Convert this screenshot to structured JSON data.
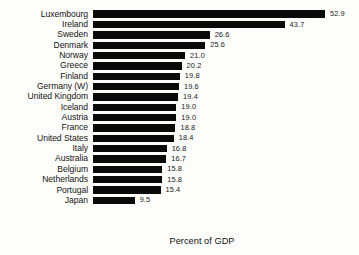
{
  "chart_data": {
    "type": "bar",
    "orientation": "horizontal",
    "title": "",
    "xlabel": "Percent of GDP",
    "ylabel": "",
    "grid": false,
    "legend": null,
    "xlim": [
      0,
      56
    ],
    "categories": [
      "Luxembourg",
      "Ireland",
      "Sweden",
      "Denmark",
      "Norway",
      "Greece",
      "Finland",
      "Germany (W)",
      "United Kingdom",
      "Iceland",
      "Austria",
      "France",
      "United States",
      "Italy",
      "Australia",
      "Belgium",
      "Netherlands",
      "Portugal",
      "Japan"
    ],
    "values": [
      52.9,
      43.7,
      26.6,
      25.6,
      21.0,
      20.2,
      19.8,
      19.6,
      19.4,
      19.0,
      19.0,
      18.8,
      18.4,
      16.8,
      16.7,
      15.8,
      15.8,
      15.4,
      9.5
    ],
    "value_labels": [
      "52.9",
      "43.7",
      "26.6",
      "25.6",
      "21.0",
      "20.2",
      "19.8",
      "19.6",
      "19.4",
      "19.0",
      "19.0",
      "18.8",
      "18.4",
      "16.8",
      "16.7",
      "15.8",
      "15.8",
      "15.4",
      "9.5"
    ],
    "bar_color": "#0a0a0a",
    "background_color": "#fdfdfb"
  },
  "axis": {
    "x_title": "Percent of GDP"
  }
}
